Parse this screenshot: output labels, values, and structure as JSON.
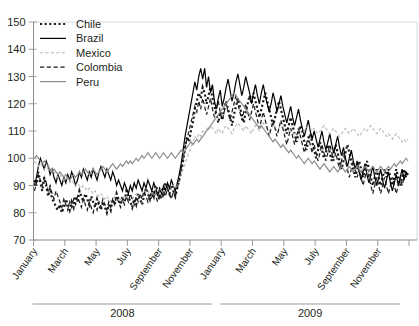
{
  "chart_data": {
    "type": "line",
    "title": "",
    "subtitle": "",
    "xlabel": "",
    "ylabel": "",
    "ylim": [
      70,
      150
    ],
    "yticks": [
      70,
      80,
      90,
      100,
      110,
      120,
      130,
      140,
      150
    ],
    "ytick_labels": [
      "70",
      "80",
      "90",
      "100",
      "110",
      "120",
      "130",
      "140",
      "150"
    ],
    "grid": false,
    "legend_position": "top-left",
    "x_tick_labels": [
      "January",
      "March",
      "May",
      "July",
      "September",
      "November",
      "January",
      "March",
      "May",
      "July",
      "September",
      "November"
    ],
    "x_group_labels": [
      "2008",
      "2009"
    ],
    "x_months": [
      "2008-01",
      "2008-02",
      "2008-03",
      "2008-04",
      "2008-05",
      "2008-06",
      "2008-07",
      "2008-08",
      "2008-09",
      "2008-10",
      "2008-11",
      "2008-12",
      "2009-01",
      "2009-02",
      "2009-03",
      "2009-04",
      "2009-05",
      "2009-06",
      "2009-07",
      "2009-08",
      "2009-09",
      "2009-10",
      "2009-11",
      "2009-12"
    ],
    "x_range": [
      "2008-01",
      "2009-12"
    ],
    "series": [
      {
        "name": "Chile",
        "color": "#1a1a1a",
        "style": "dotted",
        "width": 2.2,
        "values": [
          92,
          90,
          95,
          91,
          88,
          93,
          90,
          86,
          89,
          85,
          84,
          82,
          81,
          83,
          80,
          82,
          85,
          83,
          81,
          84,
          82,
          86,
          84,
          88,
          86,
          84,
          87,
          85,
          83,
          86,
          84,
          82,
          85,
          83,
          81,
          84,
          82,
          80,
          83,
          81,
          85,
          83,
          87,
          85,
          83,
          86,
          84,
          88,
          86,
          84,
          82,
          85,
          83,
          87,
          85,
          83,
          86,
          89,
          87,
          85,
          88,
          86,
          90,
          88,
          86,
          89,
          87,
          91,
          89,
          87,
          90,
          88,
          86,
          89,
          92,
          95,
          99,
          104,
          108,
          106,
          110,
          113,
          118,
          121,
          124,
          122,
          126,
          124,
          120,
          123,
          126,
          122,
          119,
          116,
          113,
          117,
          114,
          118,
          121,
          118,
          115,
          112,
          116,
          119,
          122,
          119,
          116,
          113,
          117,
          120,
          123,
          120,
          124,
          121,
          118,
          115,
          118,
          121,
          124,
          121,
          118,
          115,
          112,
          115,
          118,
          121,
          118,
          115,
          112,
          109,
          112,
          115,
          112,
          109,
          106,
          109,
          112,
          109,
          106,
          103,
          106,
          109,
          106,
          103,
          100,
          103,
          106,
          103,
          100,
          102,
          105,
          102,
          99,
          102,
          105,
          102,
          99,
          96,
          99,
          102,
          105,
          102,
          99,
          96,
          93,
          96,
          99,
          96,
          93,
          96,
          99,
          96,
          93,
          90,
          93,
          96,
          93,
          90,
          93,
          96,
          93,
          96,
          93,
          90,
          93,
          96,
          93,
          90,
          93,
          96,
          93,
          95
        ]
      },
      {
        "name": "Brazil",
        "color": "#000000",
        "style": "solid",
        "width": 1.2,
        "values": [
          90,
          93,
          97,
          100,
          98,
          96,
          99,
          97,
          94,
          96,
          93,
          91,
          94,
          92,
          90,
          93,
          91,
          94,
          92,
          95,
          93,
          90,
          92,
          95,
          93,
          96,
          94,
          92,
          95,
          93,
          96,
          94,
          92,
          95,
          97,
          95,
          93,
          96,
          94,
          92,
          95,
          93,
          90,
          92,
          90,
          88,
          91,
          89,
          87,
          90,
          88,
          91,
          89,
          92,
          90,
          88,
          91,
          89,
          92,
          90,
          88,
          91,
          89,
          86,
          89,
          87,
          90,
          88,
          91,
          89,
          92,
          90,
          88,
          91,
          94,
          98,
          103,
          108,
          112,
          116,
          120,
          124,
          128,
          125,
          130,
          133,
          129,
          133,
          126,
          130,
          124,
          127,
          121,
          118,
          122,
          125,
          119,
          122,
          126,
          129,
          125,
          121,
          124,
          128,
          131,
          127,
          123,
          126,
          130,
          127,
          124,
          120,
          124,
          127,
          123,
          120,
          124,
          127,
          123,
          120,
          117,
          120,
          124,
          121,
          117,
          120,
          123,
          119,
          116,
          113,
          116,
          119,
          115,
          112,
          115,
          118,
          114,
          111,
          108,
          111,
          114,
          110,
          107,
          110,
          107,
          104,
          107,
          110,
          106,
          103,
          106,
          109,
          105,
          102,
          105,
          108,
          104,
          101,
          104,
          100,
          97,
          100,
          103,
          99,
          96,
          99,
          95,
          92,
          95,
          98,
          94,
          91,
          94,
          97,
          93,
          90,
          93,
          96,
          92,
          89,
          92,
          95,
          91,
          88,
          91,
          94,
          90,
          93,
          96,
          92,
          95,
          94
        ]
      },
      {
        "name": "Mexico",
        "color": "#b8b8b8",
        "style": "dashed",
        "width": 1.1,
        "values": [
          99,
          98,
          97,
          98,
          97,
          96,
          97,
          96,
          95,
          96,
          95,
          94,
          93,
          94,
          93,
          92,
          93,
          92,
          91,
          92,
          91,
          90,
          91,
          90,
          89,
          90,
          89,
          88,
          89,
          88,
          87,
          88,
          87,
          86,
          87,
          86,
          85,
          86,
          85,
          84,
          85,
          86,
          85,
          84,
          85,
          86,
          85,
          86,
          85,
          86,
          85,
          86,
          87,
          86,
          87,
          86,
          87,
          88,
          87,
          88,
          87,
          88,
          89,
          88,
          89,
          88,
          87,
          88,
          89,
          88,
          89,
          90,
          89,
          90,
          92,
          94,
          96,
          98,
          100,
          102,
          104,
          106,
          108,
          107,
          109,
          108,
          110,
          109,
          111,
          110,
          112,
          111,
          110,
          109,
          111,
          110,
          109,
          111,
          112,
          111,
          110,
          109,
          111,
          112,
          113,
          112,
          111,
          110,
          112,
          111,
          110,
          109,
          111,
          112,
          111,
          110,
          112,
          113,
          112,
          111,
          110,
          111,
          112,
          111,
          110,
          111,
          112,
          111,
          110,
          109,
          110,
          111,
          110,
          109,
          110,
          111,
          110,
          109,
          110,
          111,
          112,
          111,
          110,
          111,
          110,
          109,
          110,
          111,
          112,
          111,
          110,
          109,
          110,
          111,
          110,
          109,
          108,
          109,
          110,
          111,
          110,
          109,
          110,
          111,
          110,
          109,
          108,
          109,
          110,
          111,
          110,
          111,
          112,
          111,
          110,
          109,
          110,
          111,
          110,
          109,
          108,
          109,
          108,
          107,
          108,
          109,
          108,
          107,
          106,
          107,
          106,
          107
        ]
      },
      {
        "name": "Colombia",
        "color": "#1a1a1a",
        "style": "dash",
        "width": 1.2,
        "values": [
          88,
          91,
          94,
          92,
          90,
          93,
          91,
          88,
          90,
          87,
          85,
          88,
          86,
          84,
          82,
          85,
          83,
          81,
          84,
          82,
          85,
          83,
          86,
          84,
          82,
          85,
          83,
          81,
          84,
          82,
          80,
          83,
          81,
          84,
          82,
          85,
          83,
          81,
          84,
          82,
          85,
          83,
          86,
          84,
          82,
          85,
          83,
          86,
          84,
          87,
          85,
          83,
          86,
          84,
          87,
          85,
          88,
          86,
          84,
          87,
          85,
          88,
          86,
          84,
          87,
          85,
          88,
          86,
          89,
          87,
          85,
          88,
          86,
          89,
          92,
          96,
          100,
          104,
          107,
          110,
          113,
          116,
          119,
          117,
          121,
          118,
          122,
          119,
          116,
          119,
          122,
          118,
          115,
          118,
          121,
          117,
          114,
          117,
          120,
          117,
          114,
          117,
          120,
          123,
          120,
          117,
          114,
          117,
          120,
          117,
          114,
          117,
          120,
          117,
          114,
          111,
          114,
          117,
          114,
          111,
          108,
          111,
          114,
          111,
          108,
          111,
          114,
          111,
          108,
          105,
          108,
          111,
          108,
          105,
          108,
          111,
          108,
          105,
          102,
          105,
          108,
          105,
          102,
          105,
          102,
          99,
          102,
          105,
          102,
          99,
          102,
          105,
          102,
          99,
          102,
          99,
          96,
          99,
          102,
          99,
          96,
          93,
          96,
          99,
          96,
          93,
          96,
          93,
          90,
          93,
          96,
          93,
          90,
          87,
          90,
          93,
          90,
          87,
          90,
          93,
          90,
          87,
          90,
          93,
          90,
          87,
          90,
          93,
          90,
          93,
          95,
          94
        ]
      },
      {
        "name": "Peru",
        "color": "#8c8c8c",
        "style": "solid",
        "width": 1.2,
        "values": [
          100,
          101,
          100,
          99,
          98,
          99,
          98,
          97,
          96,
          95,
          96,
          95,
          94,
          95,
          94,
          93,
          94,
          93,
          92,
          93,
          94,
          93,
          94,
          95,
          94,
          95,
          96,
          95,
          94,
          95,
          96,
          95,
          94,
          95,
          96,
          97,
          96,
          95,
          96,
          97,
          98,
          97,
          96,
          97,
          98,
          97,
          98,
          99,
          98,
          99,
          98,
          99,
          100,
          99,
          100,
          101,
          100,
          101,
          102,
          101,
          100,
          101,
          102,
          101,
          100,
          101,
          102,
          101,
          100,
          101,
          102,
          101,
          100,
          101,
          102,
          103,
          102,
          103,
          104,
          105,
          106,
          105,
          106,
          107,
          106,
          107,
          108,
          109,
          110,
          111,
          112,
          113,
          114,
          115,
          116,
          117,
          118,
          119,
          120,
          121,
          122,
          123,
          124,
          123,
          122,
          121,
          120,
          119,
          118,
          117,
          116,
          115,
          114,
          113,
          112,
          111,
          112,
          111,
          110,
          109,
          108,
          107,
          106,
          107,
          106,
          105,
          104,
          105,
          104,
          103,
          102,
          103,
          102,
          101,
          100,
          101,
          100,
          99,
          98,
          99,
          100,
          99,
          98,
          99,
          98,
          97,
          96,
          97,
          98,
          97,
          96,
          95,
          96,
          97,
          96,
          95,
          96,
          97,
          96,
          95,
          96,
          97,
          96,
          95,
          96,
          97,
          96,
          95,
          96,
          97,
          96,
          95,
          96,
          97,
          96,
          95,
          96,
          97,
          96,
          95,
          96,
          97,
          96,
          97,
          98,
          97,
          98,
          99,
          98,
          99,
          100,
          99
        ]
      }
    ],
    "legend": [
      {
        "label": "Chile",
        "marker": "dotted-thick-black"
      },
      {
        "label": "Brazil",
        "marker": "solid-black"
      },
      {
        "label": "Mexico",
        "marker": "dashed-lightgray"
      },
      {
        "label": "Colombia",
        "marker": "dashed-black"
      },
      {
        "label": "Peru",
        "marker": "solid-gray"
      }
    ]
  }
}
